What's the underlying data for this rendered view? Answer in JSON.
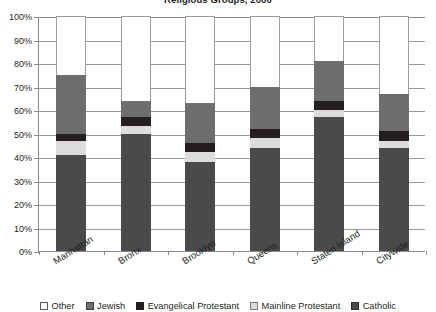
{
  "chart_data": {
    "type": "bar",
    "subtype": "stacked-100-percent",
    "title": "Religious Groups, 2000",
    "xlabel": "",
    "ylabel": "",
    "ylim": [
      0,
      100
    ],
    "ytick_labels": [
      "0%",
      "10%",
      "20%",
      "30%",
      "40%",
      "50%",
      "60%",
      "70%",
      "80%",
      "90%",
      "100%"
    ],
    "ytick_values": [
      0,
      10,
      20,
      30,
      40,
      50,
      60,
      70,
      80,
      90,
      100
    ],
    "grid": true,
    "legend_position": "bottom",
    "categories": [
      "Manhattan",
      "Bronx",
      "Brooklyn",
      "Queens",
      "Staten Island",
      "Citywide"
    ],
    "series": [
      {
        "name": "Catholic",
        "color": "#4a4a4a",
        "values": [
          41,
          50,
          38,
          44,
          57,
          44
        ]
      },
      {
        "name": "Mainline Protestant",
        "color": "#dcdcdc",
        "values": [
          6,
          3,
          4,
          4,
          3,
          3
        ]
      },
      {
        "name": "Evangelical Protestant",
        "color": "#231f20",
        "values": [
          3,
          4,
          4,
          4,
          4,
          4
        ]
      },
      {
        "name": "Jewish",
        "color": "#6e6e6e",
        "values": [
          25,
          7,
          17,
          18,
          17,
          16
        ]
      },
      {
        "name": "Other",
        "color": "#ffffff",
        "values": [
          25,
          36,
          37,
          30,
          19,
          33
        ]
      }
    ],
    "stack_tops": {
      "Catholic": [
        41,
        50,
        38,
        44,
        57,
        44
      ],
      "Mainline Protestant": [
        47,
        53,
        42,
        48,
        60,
        47
      ],
      "Evangelical Protestant": [
        50,
        57,
        46,
        52,
        64,
        51
      ],
      "Jewish": [
        75,
        64,
        63,
        70,
        81,
        67
      ],
      "Other": [
        100,
        100,
        100,
        100,
        100,
        100
      ]
    }
  },
  "legend": {
    "items": [
      {
        "label": "Other"
      },
      {
        "label": "Jewish"
      },
      {
        "label": "Evangelical Protestant"
      },
      {
        "label": "Mainline Protestant"
      },
      {
        "label": "Catholic"
      }
    ]
  }
}
